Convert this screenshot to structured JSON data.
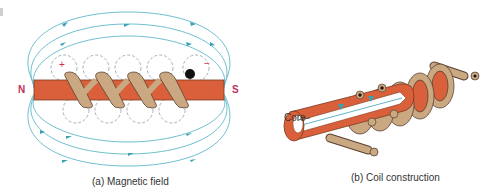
{
  "figure_a": {
    "caption": "(a) Magnetic field",
    "pole_north": "N",
    "pole_south": "S",
    "terminal_positive": "+",
    "terminal_negative": "−",
    "turns": 4
  },
  "figure_b": {
    "caption": "(b) Coil construction",
    "core_label": "Core"
  },
  "colors": {
    "core": "#d9603a",
    "core_dark": "#b0452a",
    "wire": "#c9a882",
    "wire_outline": "#5a4030",
    "field_line": "#5fb8c8",
    "pole_label": "#c0305a"
  }
}
